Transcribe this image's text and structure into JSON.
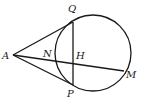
{
  "diagram": {
    "type": "geometry",
    "points": {
      "A": {
        "label": "A",
        "x": 13,
        "y": 55
      },
      "Q": {
        "label": "Q",
        "x": 73,
        "y": 22
      },
      "P": {
        "label": "P",
        "x": 73,
        "y": 85
      },
      "N": {
        "label": "N",
        "x": 55,
        "y": 60
      },
      "H": {
        "label": "H",
        "x": 73,
        "y": 63
      },
      "M": {
        "label": "M",
        "x": 124,
        "y": 71
      }
    },
    "circle": {
      "cx": 93,
      "cy": 53,
      "r": 38
    },
    "segments": [
      {
        "name": "tangent-AQ",
        "from": "A",
        "to": "Q"
      },
      {
        "name": "tangent-AP",
        "from": "A",
        "to": "P"
      },
      {
        "name": "chord-QP",
        "from": "Q",
        "to": "P"
      },
      {
        "name": "secant-AM",
        "from": "A",
        "to": "M"
      }
    ],
    "colors": {
      "stroke": "#1a1a1a",
      "background": "#ffffff"
    }
  }
}
